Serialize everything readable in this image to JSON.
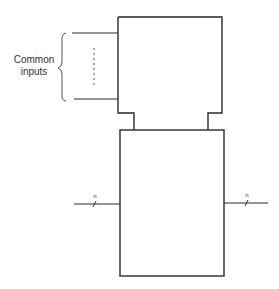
{
  "diagram": {
    "common_inputs_label_line1": "Common",
    "common_inputs_label_line2": "inputs",
    "left_bus_label": "n",
    "right_bus_label": "n",
    "stroke_color": "#2a2a2a",
    "text_color": "#333333"
  }
}
